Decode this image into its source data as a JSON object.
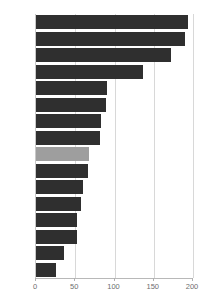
{
  "chart_data": {
    "type": "bar",
    "orientation": "horizontal",
    "title": "",
    "xlabel": "",
    "ylabel": "",
    "xlim": [
      0,
      200
    ],
    "grid": true,
    "legend": false,
    "xticks": [
      "0",
      "50",
      "100",
      "150",
      "200"
    ],
    "xtick_values": [
      0,
      50,
      100,
      150,
      200
    ],
    "categories": [
      "NL",
      "E",
      "A",
      "UK",
      "I",
      "L",
      "B",
      "D",
      "EU-15",
      "EL",
      "DK",
      "F",
      "S",
      "IRL",
      "P",
      "FIN"
    ],
    "values": [
      193,
      190,
      172,
      136,
      90,
      89,
      83,
      81,
      68,
      66,
      60,
      57,
      52,
      52,
      36,
      26
    ],
    "highlight_category": "EU-15",
    "bar_color": "#2f2f2f",
    "highlight_color": "#9e9e9e",
    "grid_color": "#d8d8d8",
    "axis_color": "#b8b8b8",
    "bars": [
      {
        "label": "NL",
        "value": 193,
        "highlight": false
      },
      {
        "label": "E",
        "value": 190,
        "highlight": false
      },
      {
        "label": "A",
        "value": 172,
        "highlight": false
      },
      {
        "label": "UK",
        "value": 136,
        "highlight": false
      },
      {
        "label": "I",
        "value": 90,
        "highlight": false
      },
      {
        "label": "L",
        "value": 89,
        "highlight": false
      },
      {
        "label": "B",
        "value": 83,
        "highlight": false
      },
      {
        "label": "D",
        "value": 81,
        "highlight": false
      },
      {
        "label": "EU-15",
        "value": 68,
        "highlight": true
      },
      {
        "label": "EL",
        "value": 66,
        "highlight": false
      },
      {
        "label": "DK",
        "value": 60,
        "highlight": false
      },
      {
        "label": "F",
        "value": 57,
        "highlight": false
      },
      {
        "label": "S",
        "value": 52,
        "highlight": false
      },
      {
        "label": "IRL",
        "value": 52,
        "highlight": false
      },
      {
        "label": "P",
        "value": 36,
        "highlight": false
      },
      {
        "label": "FIN",
        "value": 26,
        "highlight": false
      }
    ]
  }
}
